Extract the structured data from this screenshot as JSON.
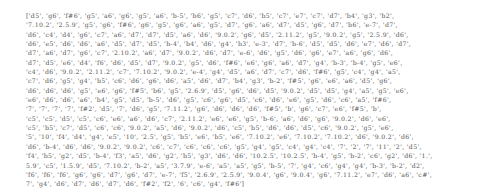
{
  "document": {
    "lines": [
      "['d5', 'g6', 'f#6', 'g5', 'a6', 'g6', 'g5', 'a6', 'b-5', 'b6', 'g5', 'c7', 'd6', 'b5', 'c7', 'e7', 'c7', 'd7', 'b4', 'g3', 'b2',",
      "'7.10.2', '2.5.9', 'g5', 'g6', 'f#6', 'g6', 'g5', 'g6', 'a6', 'g5', 'd7', 'g6', 'a6', 'd7', 'd5', 'g6', 'd7', 'b6', 'e-7', 'd7',",
      "'d6', 'c4', 'd4', 'g6', 'c7', 'a6', 'd7', 'd7', 'd5', 'a6', 'd6', '9.0.2', 'g6', 'd5', '2.11.2', 'g5', '9.0.2', 'g5', '2.5.9', 'd6',",
      "'d6', 'e5', 'd6', 'd6', 'a6', 'd5', 'd7', 'd5', 'b-4', 'b4', 'd6', 'g4', 'b3', 'e-3', 'd7', 'b-6', 'd5', 'd5', 'd6', 'e7', 'd6', 'd7',",
      "'d7', 'a6', 'd7', 'g6', 'c7', '2.10.2', 'a6', 'd7', '9.0.2', 'd6', 'd7', 'e-6', 'd6', 'g5', 'd6', 'g6', 'e7', 'a6', 'g6', 'd6',",
      "'d7', 'd5', 'e6', 'd4', 'f6', 'd6', 'd5', 'd7', '9.0.2', 'g5', 'd6', 'f#6', 'e6', 'g6', 'a6', 'd7', 'g4', 'b-3', 'b-4', 'g5', 'e6',",
      "'c4', 'd6', '9.0.2', '2.11.2', 'c7', '7.10.2', '9.0.2', 'e-4', 'g4', 'd5', 'a6', 'd7', 'c7', 'd6', 'f#6', 'g5', 'c4', 'g4', 'a5',",
      "'c7', 'd6', 'g5', 'g4', 'b5', 'c6', 'd6', 'g6', 'd6', 'a5', 'd6', 'd7', 'b4', 'g3', 'b-2', 'f#5', 'g6', 'e6', 'a6', 'd5', 'g6',",
      "'d6', 'd6', 'd6', 'g5', 'e6', 'g6', 'f#5', 'b6', 'g5', '2.6.9', 'd5', 'g6', 'd6', 'd5', '9.0.2', 'd5', 'd5', 'g4', 'a5', 'g5', 'e6',",
      "'e6', 'd6', 'd6', 'a6', 'b4', 'g5', 'd5', 'b-5', 'd6', 'g5', 'c6', 'g6', 'd5', 'c6', 'd6', 'e6', 'g5', 'd6', 'c6', 'a5', 'f#6',",
      "'7', '7', '7', '7', 'f#2', 'd5', '7', 'd6', 'g5', '7.11.2', 'g6', 'd6', 'd6', 'd6', 'f#5', 'b', 'g6', 'c7', 'e6', 'f#5', 'b',",
      "'c5', 'c5', 'd5', 'c5', 'c6', 'e6', 'a6', 'd6', 'c7', '2.11.2', 'e6', 'e6', 'g5', 'b-6', 'a6', 'd6', 'g6', '9.0.2', 'd6', 'e6',",
      "'c5', 'b5', 'c7', 'd5', 'c6', 'c6', '9.0.2', 'a5', 'd6', '9.0.2', 'd6', 'c5', 'b5', 'd6', 'd6', 'd5', 'c6', '9.0.2', 'g5', 'e6',",
      "'5', '10', 'f4', 'd4', 'g4', 'e5', '10', '2.5', 'g5', 'b5', 'e6', 'b5', 'e6', '7.10.2', 'e6', '7.10.2', '7.10.2', 'd6', '9.0.2', 'd6',",
      "'d6', 'b-4', 'd6', 'd6', '9.0.2', '9.0.2', 'c6', 'c7', 'c6', 'c6', 'c6', 'g5', 'g4', 'g5', 'c4', 'g4', 'c4', '7', '2', '7', '11', '2', 'd5',",
      "'f4', 'b5', 'g2', 'd5', 'b-4', 'f3', 'a5', 'd6', 'g2', 'b5', 'g3', 'd6', 'd6', '10.2.5', '10.2.5', 'b-4', 'g5', 'b-2', 'c6', 'g2', 'd6', '1.',",
      "5.9', 'c5', '1.5.9', 'd5', '7.10.2', 'b-2', 'a5', '3.7.9', 'e-6', 'a5', 'a5', 'g5', 'b-5', '7', 'g4', 'c6', 'g4', 'g4', 'b-3', 'b-2', 'd2',",
      "'f6', 'f6', 'f6', 'g6', 'g6', 'd7', 'g6', 'd7', 'e-7', 'f5', '2.6.9', '2.5.9', '9.0.4', 'g6', '9.0.4', 'g6', '7.11.2', 'e7', 'd6', 'a6', 'c#',",
      "7', 'g4', 'd6', 'd7', 'd6', 'd7', 'd6', 'f#2', 'f2', '6', 'c6', 'g4', 'f#6']"
    ]
  }
}
